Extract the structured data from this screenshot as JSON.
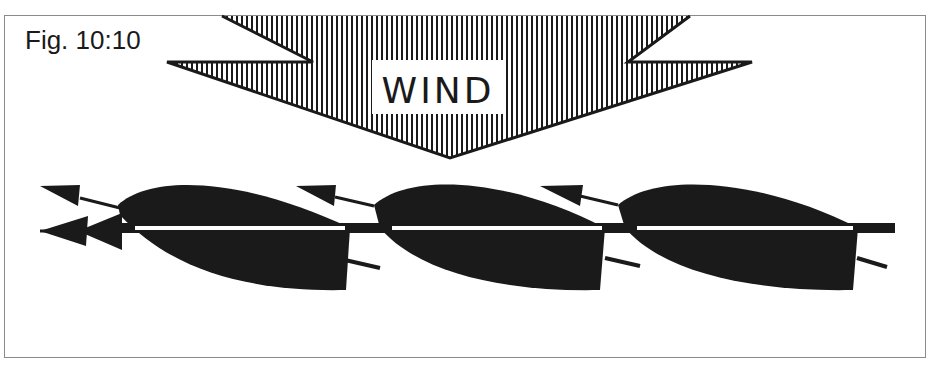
{
  "figure": {
    "label": "Fig. 10:10",
    "wind_label": "WIND",
    "wind_direction": "down",
    "boat_count": 3,
    "colors": {
      "ink": "#1a1a1a",
      "frame": "#8a8a8a",
      "background": "#ffffff"
    }
  },
  "boats": [
    {
      "name": "boat-1",
      "arrows": 3
    },
    {
      "name": "boat-2",
      "arrows": 1
    },
    {
      "name": "boat-3",
      "arrows": 1
    }
  ]
}
